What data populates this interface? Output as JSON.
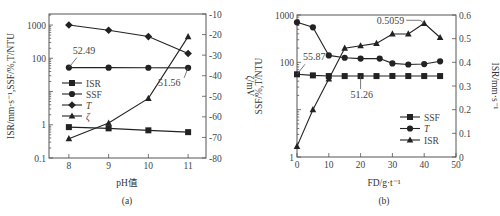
{
  "figure": {
    "captions": [
      "(a)",
      "(b)"
    ]
  },
  "chart_data": [
    {
      "type": "line",
      "panel": "(a)",
      "xlabel": "pH值",
      "ylabel_left": "ISR/mm·s⁻¹,SSF/%,T/NTU",
      "ylabel_right": "ζ/mV",
      "x": [
        8,
        9,
        10,
        11
      ],
      "x_ticks": [
        "8",
        "9",
        "10",
        "11"
      ],
      "xlim": [
        7.5,
        11.45
      ],
      "y_left_scale": "log",
      "y_left_ticks": [
        "0.1",
        "1",
        "100",
        "1000"
      ],
      "y_left_lim": [
        0.1,
        2150
      ],
      "y_right_ticks": [
        "-10",
        "-20",
        "-30",
        "-40",
        "-50",
        "-60",
        "-70",
        "-80"
      ],
      "y_right_lim": [
        -80,
        -10
      ],
      "series": [
        {
          "name": "ISR",
          "marker": "square",
          "axis": "left",
          "values": [
            0.85,
            0.78,
            0.68,
            0.6
          ]
        },
        {
          "name": "SSF",
          "marker": "circle",
          "axis": "left",
          "values": [
            52.49,
            52.2,
            51.9,
            51.56
          ]
        },
        {
          "name": "T",
          "marker": "diamond",
          "axis": "left",
          "values": [
            1000,
            700,
            450,
            140
          ]
        },
        {
          "name": "ζ",
          "marker": "triangle",
          "axis": "right",
          "values": [
            -70.6,
            -63,
            -51,
            -21
          ]
        }
      ],
      "annotations": [
        {
          "text": "52.49",
          "x": 8,
          "series": "SSF"
        },
        {
          "text": "51.56",
          "x": 11,
          "series": "SSF"
        }
      ],
      "legend": [
        "ISR",
        "SSF",
        "T",
        "ζ"
      ],
      "legend_position": "center-left",
      "grid": false
    },
    {
      "type": "line",
      "panel": "(b)",
      "xlabel": "FD/g·t⁻¹",
      "ylabel_left": "SSF/%,T/NTU",
      "ylabel_right": "ISR/mm·s⁻¹",
      "x_ticks": [
        "0",
        "10",
        "20",
        "30",
        "40",
        "50"
      ],
      "xlim": [
        0,
        50
      ],
      "y_left_scale": "log",
      "y_left_ticks": [
        "1",
        "100",
        "1000"
      ],
      "y_left_lim": [
        1,
        1000
      ],
      "y_right_ticks": [
        "0",
        "0.1",
        "0.2",
        "0.3",
        "0.4",
        "0.5",
        "0.6"
      ],
      "y_right_lim": [
        0,
        0.6
      ],
      "series": [
        {
          "name": "SSF",
          "marker": "square",
          "axis": "left",
          "x": [
            0,
            5,
            10,
            15,
            20,
            25,
            30,
            35,
            40,
            45
          ],
          "values": [
            55.87,
            53,
            51.26,
            51.26,
            51.26,
            51.26,
            51.5,
            51.3,
            51.3,
            51.3
          ]
        },
        {
          "name": "T",
          "marker": "circle",
          "axis": "left",
          "x": [
            0,
            5,
            10,
            15,
            20,
            26,
            30,
            35,
            40,
            45
          ],
          "values": [
            700,
            550,
            140,
            125,
            120,
            120,
            95,
            90,
            92,
            105
          ]
        },
        {
          "name": "ISR",
          "marker": "triangle",
          "axis": "right",
          "x": [
            0,
            5,
            10,
            15,
            20,
            25,
            30,
            35,
            40,
            45
          ],
          "values": [
            0.045,
            0.2,
            0.33,
            0.46,
            0.47,
            0.48,
            0.52,
            0.52,
            0.565,
            0.505
          ]
        }
      ],
      "annotations": [
        {
          "text": "55.87",
          "x": 0,
          "series": "SSF"
        },
        {
          "text": "51.26",
          "x": 20,
          "series": "SSF"
        },
        {
          "text": "0.5059",
          "x": 40,
          "series": "ISR"
        }
      ],
      "legend": [
        "SSF",
        "T",
        "ISR"
      ],
      "legend_position": "lower-right",
      "grid": false
    }
  ]
}
